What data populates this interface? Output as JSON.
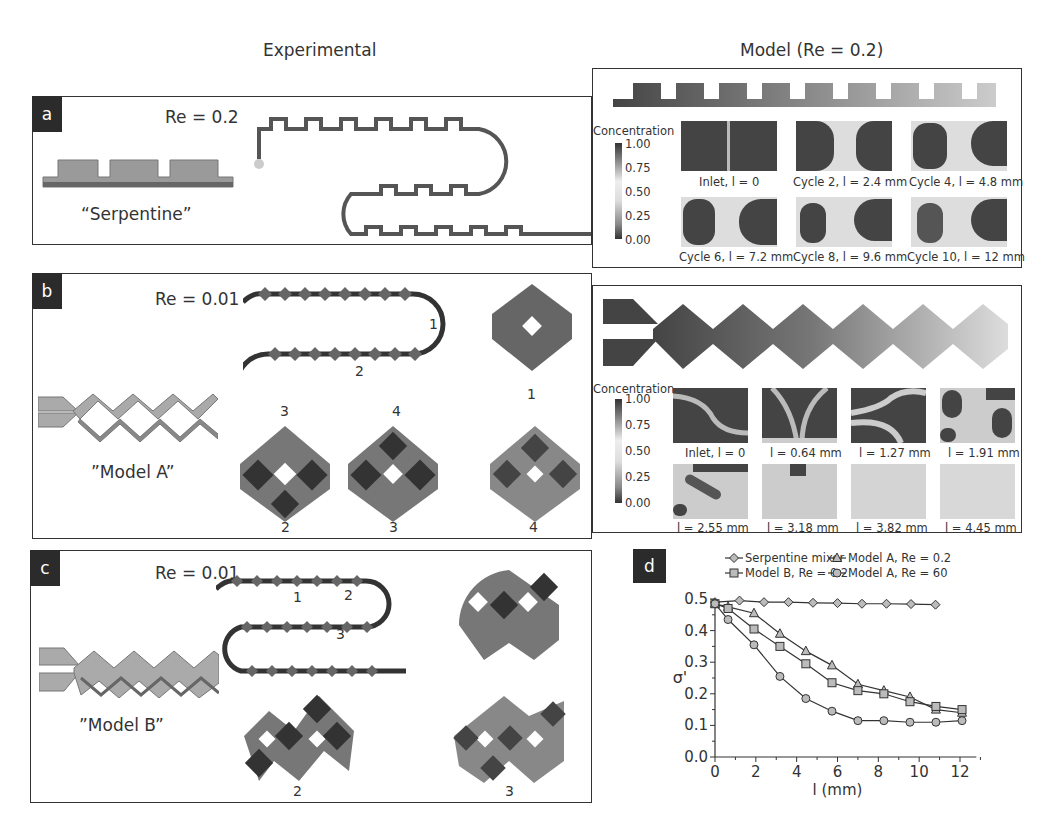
{
  "columns": {
    "experimental": "Experimental",
    "model": "Model (Re = 0.2)"
  },
  "panels": {
    "a": {
      "label": "a",
      "re": "Re = 0.2",
      "name": "“Serpentine”"
    },
    "b": {
      "label": "b",
      "re": "Re = 0.01",
      "name": "”Model A”",
      "channel_marks": [
        "1",
        "2",
        "3",
        "4"
      ],
      "cross_sections": [
        "1",
        "2",
        "3",
        "4"
      ]
    },
    "c": {
      "label": "c",
      "re": "Re = 0.01",
      "name": "”Model B”",
      "channel_marks": [
        "1",
        "2",
        "3"
      ],
      "cross_sections": [
        "2",
        "3"
      ]
    },
    "d": {
      "label": "d"
    }
  },
  "model_a": {
    "colorbar": {
      "title": "Concentration",
      "ticks": [
        "1.00",
        "0.75",
        "0.50",
        "0.25",
        "0.00"
      ]
    },
    "captions": [
      "Inlet, l = 0",
      "Cycle 2, l = 2.4 mm",
      "Cycle 4, l = 4.8 mm",
      "Cycle 6, l = 7.2 mm",
      "Cycle 8, l = 9.6 mm",
      "Cycle 10, l = 12 mm"
    ]
  },
  "model_b": {
    "colorbar": {
      "title": "Concentration",
      "ticks": [
        "1.00",
        "0.75",
        "0.50",
        "0.25",
        "0.00"
      ]
    },
    "captions": [
      "Inlet, l = 0",
      "l = 0.64 mm",
      "l = 1.27 mm",
      "l = 1.91 mm",
      "l = 2.55 mm",
      "l = 3.18 mm",
      "l = 3.82 mm",
      "l = 4.45 mm"
    ]
  },
  "chart_data": {
    "type": "line",
    "title": "",
    "xlabel": "l (mm)",
    "ylabel": "σ'",
    "xlim": [
      0,
      12.8
    ],
    "ylim": [
      0.0,
      0.5
    ],
    "xticks": [
      0,
      2,
      4,
      6,
      8,
      10,
      12
    ],
    "yticks": [
      "0.0",
      "0.1",
      "0.2",
      "0.3",
      "0.4",
      "0.5"
    ],
    "grid": false,
    "legend_position": "top",
    "series": [
      {
        "name": "Serpentine mixer",
        "marker": "diamond",
        "x": [
          0,
          1.2,
          2.4,
          3.6,
          4.8,
          6.0,
          7.2,
          8.4,
          9.6,
          10.8
        ],
        "y": [
          0.49,
          0.495,
          0.49,
          0.49,
          0.488,
          0.487,
          0.485,
          0.485,
          0.484,
          0.482
        ]
      },
      {
        "name": "Model A, Re = 0.2",
        "marker": "triangle",
        "x": [
          0,
          0.64,
          1.91,
          3.18,
          4.45,
          5.73,
          7.0,
          8.27,
          9.55,
          10.82,
          12.1
        ],
        "y": [
          0.485,
          0.475,
          0.455,
          0.39,
          0.335,
          0.29,
          0.23,
          0.21,
          0.19,
          0.15,
          0.14
        ]
      },
      {
        "name": "Model B, Re = 0.2",
        "marker": "square",
        "x": [
          0,
          0.64,
          1.91,
          3.18,
          4.45,
          5.73,
          7.0,
          8.27,
          9.55,
          10.82,
          12.1
        ],
        "y": [
          0.485,
          0.47,
          0.405,
          0.35,
          0.295,
          0.235,
          0.21,
          0.2,
          0.175,
          0.16,
          0.15
        ]
      },
      {
        "name": "Model A, Re = 60",
        "marker": "circle",
        "x": [
          0,
          0.64,
          1.91,
          3.18,
          4.45,
          5.73,
          7.0,
          8.27,
          9.55,
          10.82,
          12.1
        ],
        "y": [
          0.485,
          0.435,
          0.355,
          0.255,
          0.185,
          0.145,
          0.115,
          0.115,
          0.11,
          0.11,
          0.115
        ]
      }
    ]
  }
}
